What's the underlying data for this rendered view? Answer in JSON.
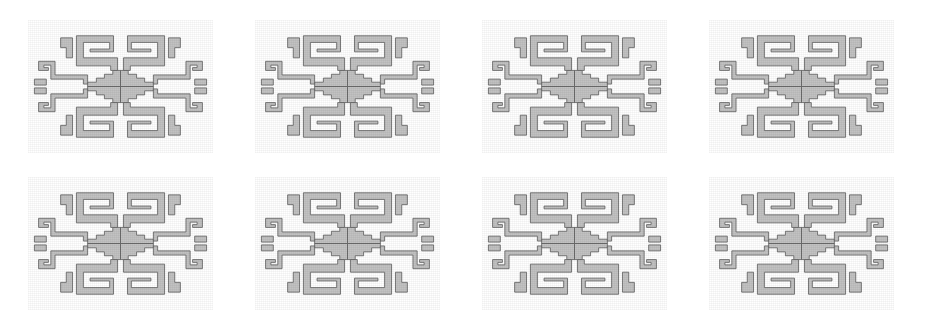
{
  "image": {
    "title": "Stepped Fret Motif Pattern",
    "description": "Repeating Andean-style stepped fret (greca) motif arranged in a grid",
    "width": 941,
    "height": 328
  },
  "canvas": {
    "background_color": "#ffffff"
  },
  "motif": {
    "name": "stepped-fret-greca",
    "fill_color": "#c2c2c2",
    "outline_color": "#5e5e5e",
    "outline_width": 1.6,
    "tile_width": 185,
    "tile_height": 133,
    "symmetry": "4-fold mirror (horizontal and vertical)",
    "center_shape": "stepped diamond",
    "arm_shape": "meander spiral hook"
  },
  "grid": {
    "columns": 4,
    "rows": 2,
    "pitch_x": 227,
    "pitch_y": 157,
    "origin_x": 28,
    "origin_y": 20,
    "tile_count": 8,
    "tiles": [
      {
        "label": "tile-r1-c1",
        "row": 1,
        "col": 1,
        "x": 28,
        "y": 20
      },
      {
        "label": "tile-r1-c2",
        "row": 1,
        "col": 2,
        "x": 255,
        "y": 20
      },
      {
        "label": "tile-r1-c3",
        "row": 1,
        "col": 3,
        "x": 482,
        "y": 20
      },
      {
        "label": "tile-r1-c4",
        "row": 1,
        "col": 4,
        "x": 709,
        "y": 20
      },
      {
        "label": "tile-r2-c1",
        "row": 2,
        "col": 1,
        "x": 28,
        "y": 177
      },
      {
        "label": "tile-r2-c2",
        "row": 2,
        "col": 2,
        "x": 255,
        "y": 177
      },
      {
        "label": "tile-r2-c3",
        "row": 2,
        "col": 3,
        "x": 482,
        "y": 177
      },
      {
        "label": "tile-r2-c4",
        "row": 2,
        "col": 4,
        "x": 709,
        "y": 177
      }
    ]
  }
}
